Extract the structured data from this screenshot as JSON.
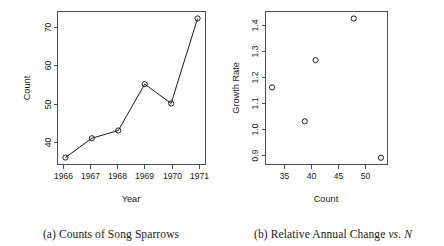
{
  "figure": {
    "panels": [
      {
        "key": "a",
        "caption_prefix": "(a)",
        "caption_text": "Counts of Song Sparrows",
        "caption_italic": "",
        "caption_tail": ""
      },
      {
        "key": "b",
        "caption_prefix": "(b)",
        "caption_text": "Relative Annual Change",
        "caption_italic": "vs.",
        "caption_tail": "N"
      }
    ]
  },
  "chart_data": [
    {
      "type": "line",
      "title": "(a) Counts of Song Sparrows",
      "xlabel": "Year",
      "ylabel": "Count",
      "x": [
        1966,
        1967,
        1968,
        1969,
        1970,
        1971
      ],
      "values": [
        35,
        40,
        42,
        54,
        49,
        71
      ],
      "categories": [
        "1966",
        "1967",
        "1968",
        "1969",
        "1970",
        "1971"
      ],
      "xticks": [
        1966,
        1967,
        1968,
        1969,
        1970,
        1971
      ],
      "xticklabels": [
        "1966",
        "1967",
        "1968",
        "1969",
        "1970",
        "1971"
      ],
      "yticks": [
        40,
        50,
        60,
        70
      ],
      "yticklabels": [
        "40",
        "50",
        "60",
        "70"
      ],
      "xlim": [
        1965.7,
        1971.3
      ],
      "ylim": [
        33.2,
        72.8
      ],
      "grid": false,
      "legend": false,
      "marker": "open-circle",
      "line_color": "#1a1a1a",
      "marker_color": "#1a1a1a"
    },
    {
      "type": "scatter",
      "title": "(b) Relative Annual Change vs. N",
      "xlabel": "Count",
      "ylabel": "Growth Rate",
      "x": [
        34,
        40,
        42,
        49,
        54
      ],
      "values": [
        1.18,
        1.05,
        1.285,
        1.445,
        0.91
      ],
      "xticks": [
        35,
        40,
        45,
        50
      ],
      "xticklabels": [
        "35",
        "40",
        "45",
        "50"
      ],
      "yticks": [
        0.9,
        1.0,
        1.1,
        1.2,
        1.3,
        1.4
      ],
      "yticklabels": [
        "0.9",
        "1.0",
        "1.1",
        "1.2",
        "1.3",
        "1.4"
      ],
      "xlim": [
        32.8,
        55.2
      ],
      "ylim": [
        0.884,
        1.472
      ],
      "grid": false,
      "legend": false,
      "marker": "open-circle",
      "marker_color": "#1a1a1a"
    }
  ]
}
